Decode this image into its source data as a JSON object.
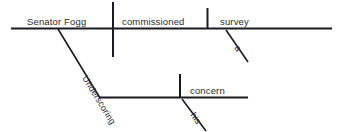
{
  "diagram": {
    "type": "reed-kellogg-sentence-diagram",
    "sentence": "Underscoring his concern, Senator Fogg commissioned a survey",
    "ink_color": "#1a1a22",
    "background_color": "#ffffff",
    "main_clause": {
      "subject": "Senator Fogg",
      "verb": "commissioned",
      "direct_object": "survey",
      "object_modifier": "a"
    },
    "participial_phrase": {
      "participle": "Underscoring",
      "object": "concern",
      "object_modifier": "his"
    },
    "labels": {
      "subject": "Senator Fogg",
      "verb": "commissioned",
      "direct_object": "survey",
      "article_a": "a",
      "participle": "Underscoring",
      "participle_object": "concern",
      "possessive_his": "his"
    }
  }
}
